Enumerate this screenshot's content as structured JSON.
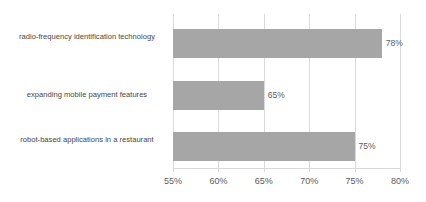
{
  "chart_data": {
    "type": "bar",
    "orientation": "horizontal",
    "title": "",
    "subtitle": "",
    "xlabel": "",
    "ylabel": "",
    "categories": [
      "radio-frequency identification technology",
      "expanding mobile payment features",
      "robot-based applications in a restaurant"
    ],
    "values": [
      78,
      65,
      75
    ],
    "value_labels": [
      "78%",
      "65%",
      "75%"
    ],
    "xlim": [
      55,
      80
    ],
    "xticks": [
      55,
      60,
      65,
      70,
      75,
      80
    ],
    "xtick_labels": [
      "55%",
      "60%",
      "65%",
      "70%",
      "75%",
      "80%"
    ],
    "grid": true,
    "grid_axis": "x",
    "legend": false,
    "legend_position": "none",
    "colors": {
      "bar": "#a6a6a6",
      "gridline": "#d9d9d9",
      "axis": "#d9d9d9",
      "category_text": "#464646",
      "value_text": "#5a5a5a",
      "tick_text": "#5a5a5a",
      "background": "#ffffff"
    }
  },
  "axis": {
    "ticks": [
      {
        "label": "55%",
        "value": 55
      },
      {
        "label": "60%",
        "value": 60
      },
      {
        "label": "65%",
        "value": 65
      },
      {
        "label": "70%",
        "value": 70
      },
      {
        "label": "75%",
        "value": 75
      },
      {
        "label": "80%",
        "value": 80
      }
    ]
  },
  "bars": [
    {
      "category": "radio-frequency identification technology",
      "value": 78,
      "value_label": "78%"
    },
    {
      "category": "expanding mobile payment features",
      "value": 65,
      "value_label": "65%"
    },
    {
      "category": "robot-based applications in a restaurant",
      "value": 75,
      "value_label": "75%"
    }
  ]
}
